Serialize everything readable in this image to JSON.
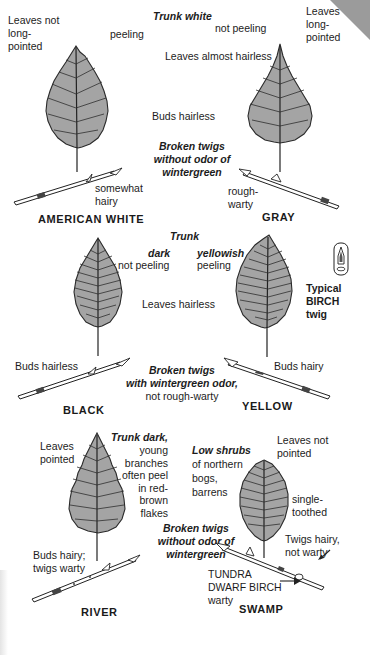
{
  "page": {
    "type": "field-guide-plate",
    "colors": {
      "leaf_fill": "#a4a4a4",
      "ink": "#1a1a1a",
      "background": "#ffffff",
      "corner": "#8a8a8a"
    }
  },
  "top_section": {
    "trunk_heading": "Trunk white",
    "shared_notes": {
      "leaves": "Leaves almost hairless",
      "buds": "Buds hairless",
      "twigs": "Broken twigs\nwithout odor of\nwintergreen"
    },
    "species": [
      {
        "name": "AMERICAN WHITE",
        "leaf_note": "Leaves not\nlong-\npointed",
        "trunk_note": "peeling",
        "twig_note": "somewhat\nhairy"
      },
      {
        "name": "GRAY",
        "leaf_note": "Leaves\nlong-\npointed",
        "trunk_note": "not peeling",
        "twig_note": "rough-\nwarty"
      }
    ]
  },
  "middle_section": {
    "trunk_heading": "Trunk",
    "shared_notes": {
      "leaves": "Leaves hairless",
      "twigs_bold": "Broken twigs\nwith wintergreen odor,",
      "twigs_plain": "not rough-warty"
    },
    "typical_twig_label": "Typical\nBIRCH\ntwig",
    "species": [
      {
        "name": "BLACK",
        "trunk_color": "dark",
        "trunk_note": "not peeling",
        "bud_note": "Buds hairless"
      },
      {
        "name": "YELLOW",
        "trunk_color": "yellowish",
        "trunk_note": "peeling",
        "bud_note": "Buds hairy"
      }
    ]
  },
  "bottom_section": {
    "shared_notes": {
      "twigs": "Broken twigs\nwithout odor of\nwintergreen"
    },
    "species": [
      {
        "name": "RIVER",
        "leaf_note": "Leaves\npointed",
        "trunk_note_bold": "Trunk dark,",
        "trunk_note": "young\nbranches\noften peel\nin red-\nbrown\nflakes",
        "bud_note": "Buds hairy;\ntwigs warty"
      },
      {
        "name": "SWAMP",
        "habitat_bold": "Low shrubs",
        "habitat": "of northern\nbogs,\nbarrens",
        "leaf_note": "Leaves not\npointed",
        "tooth_note": "single-\ntoothed",
        "twig_note": "Twigs hairy,\nnot warty",
        "related": "TUNDRA\nDWARF BIRCH",
        "related_note": "warty"
      }
    ]
  }
}
